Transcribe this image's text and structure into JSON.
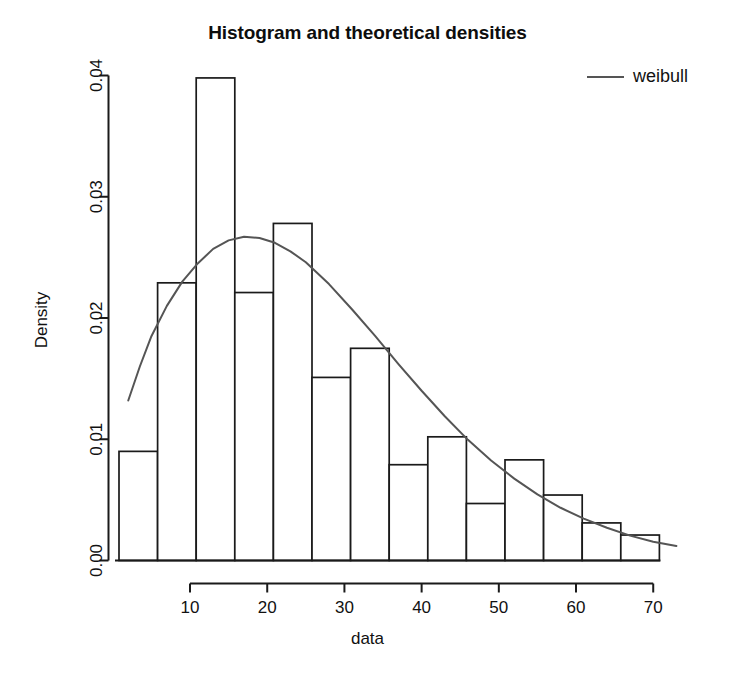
{
  "chart_data": {
    "type": "bar",
    "title": "Histogram and theoretical densities",
    "xlabel": "data",
    "ylabel": "Density",
    "grid": false,
    "legend_position": "top-right",
    "legend": [
      {
        "label": "weibull",
        "color": "#555555",
        "style": "line"
      }
    ],
    "xlim": [
      0,
      76
    ],
    "ylim": [
      0.0,
      0.04
    ],
    "xticks": [
      10,
      20,
      30,
      40,
      50,
      60,
      70
    ],
    "xtick_labels": [
      "10",
      "20",
      "30",
      "40",
      "50",
      "60",
      "70"
    ],
    "yticks": [
      0.0,
      0.01,
      0.02,
      0.03,
      0.04
    ],
    "ytick_labels": [
      "0.00",
      "0.01",
      "0.02",
      "0.03",
      "0.04"
    ],
    "bin_width": 5,
    "bin_edges": [
      0.8,
      5.8,
      10.8,
      15.8,
      20.8,
      25.8,
      30.8,
      35.8,
      40.8,
      45.8,
      50.8,
      55.8,
      60.8,
      65.8,
      70.8,
      75.8
    ],
    "categories": [
      "0.8-5.8",
      "5.8-10.8",
      "10.8-15.8",
      "15.8-20.8",
      "20.8-25.8",
      "25.8-30.8",
      "30.8-35.8",
      "35.8-40.8",
      "40.8-45.8",
      "45.8-50.8",
      "50.8-55.8",
      "55.8-60.8",
      "60.8-65.8",
      "65.8-70.8",
      "70.8-75.8"
    ],
    "values": [
      0.009,
      0.0229,
      0.0398,
      0.0221,
      0.0278,
      0.0151,
      0.0175,
      0.0079,
      0.0102,
      0.0047,
      0.0083,
      0.0054,
      0.0031,
      0.0021,
      0.0
    ],
    "series": [
      {
        "name": "weibull",
        "type": "line",
        "color": "#555555",
        "x": [
          2.0,
          3.5,
          5.0,
          7.0,
          9.0,
          11.0,
          13.0,
          15.0,
          17.0,
          19.0,
          21.0,
          23.0,
          25.0,
          28.0,
          31.0,
          34.0,
          37.0,
          40.0,
          43.0,
          46.0,
          49.0,
          52.0,
          55.0,
          58.0,
          61.0,
          64.0,
          67.0,
          70.0,
          73.0
        ],
        "y": [
          0.0132,
          0.016,
          0.0185,
          0.021,
          0.023,
          0.0245,
          0.0257,
          0.0264,
          0.0267,
          0.0266,
          0.0262,
          0.0255,
          0.0246,
          0.0228,
          0.0207,
          0.0185,
          0.0162,
          0.014,
          0.0119,
          0.00995,
          0.00825,
          0.00675,
          0.00545,
          0.00435,
          0.00345,
          0.0027,
          0.00205,
          0.00155,
          0.0012
        ]
      }
    ]
  },
  "legend": {
    "weibull_label": "weibull"
  },
  "axes": {
    "title": "Histogram and theoretical densities",
    "xlabel": "data",
    "ylabel": "Density"
  }
}
